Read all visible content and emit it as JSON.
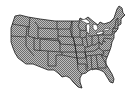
{
  "map": {
    "subject": "Contiguous United States with state boundaries",
    "fill_style": "dithered-gray",
    "colors": {
      "background": "#ffffff",
      "fill_light": "#bdbdbd",
      "fill_dark": "#6e6e6e",
      "border": "#1a1a1a",
      "water": "#ffffff"
    },
    "labels": []
  }
}
